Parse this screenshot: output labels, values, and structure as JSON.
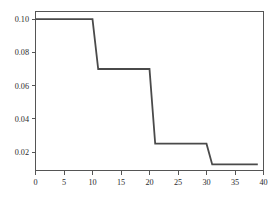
{
  "chart_data": {
    "type": "line",
    "title": "",
    "subtitle": "",
    "xlabel": "",
    "ylabel": "",
    "xlim": [
      0,
      40
    ],
    "ylim": [
      0.008,
      0.105
    ],
    "grid": false,
    "legend": null,
    "legend_position": "none",
    "line_style": "step-post",
    "series": [
      {
        "name": "schedule",
        "color": "#4a4a4a",
        "x": [
          0,
          10,
          11,
          20,
          21,
          30,
          31,
          39
        ],
        "values": [
          0.1,
          0.1,
          0.07,
          0.07,
          0.025,
          0.025,
          0.0125,
          0.0125
        ],
        "steps": [
          {
            "x_start": 0,
            "x_end": 10,
            "y": 0.1
          },
          {
            "x_start": 11,
            "x_end": 20,
            "y": 0.07
          },
          {
            "x_start": 21,
            "x_end": 30,
            "y": 0.025
          },
          {
            "x_start": 31,
            "x_end": 39,
            "y": 0.0125
          }
        ]
      }
    ],
    "x_ticks": [
      0,
      5,
      10,
      15,
      20,
      25,
      30,
      35,
      40
    ],
    "x_tick_labels": [
      "0",
      "5",
      "10",
      "15",
      "20",
      "25",
      "30",
      "35",
      "40"
    ],
    "y_ticks": [
      0.02,
      0.04,
      0.06,
      0.08,
      0.1
    ],
    "y_tick_labels": [
      "0.02",
      "0.04",
      "0.06",
      "0.08",
      "0.10"
    ],
    "colors": {
      "line": "#4a4a4a",
      "axis": "#555555",
      "text": "#2b2b2b",
      "background": "#ffffff"
    }
  }
}
